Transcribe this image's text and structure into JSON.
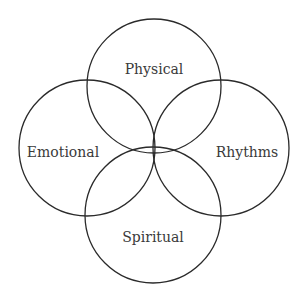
{
  "diagram": {
    "type": "venn",
    "circles": [
      {
        "id": "physical",
        "label": "Physical",
        "position": "top"
      },
      {
        "id": "emotional",
        "label": "Emotional",
        "position": "left"
      },
      {
        "id": "rhythms",
        "label": "Rhythms",
        "position": "right"
      },
      {
        "id": "spiritual",
        "label": "Spiritual",
        "position": "bottom"
      }
    ],
    "stroke_color": "#2a2a2a",
    "text_color": "#3a3a3a",
    "background": "#ffffff"
  }
}
